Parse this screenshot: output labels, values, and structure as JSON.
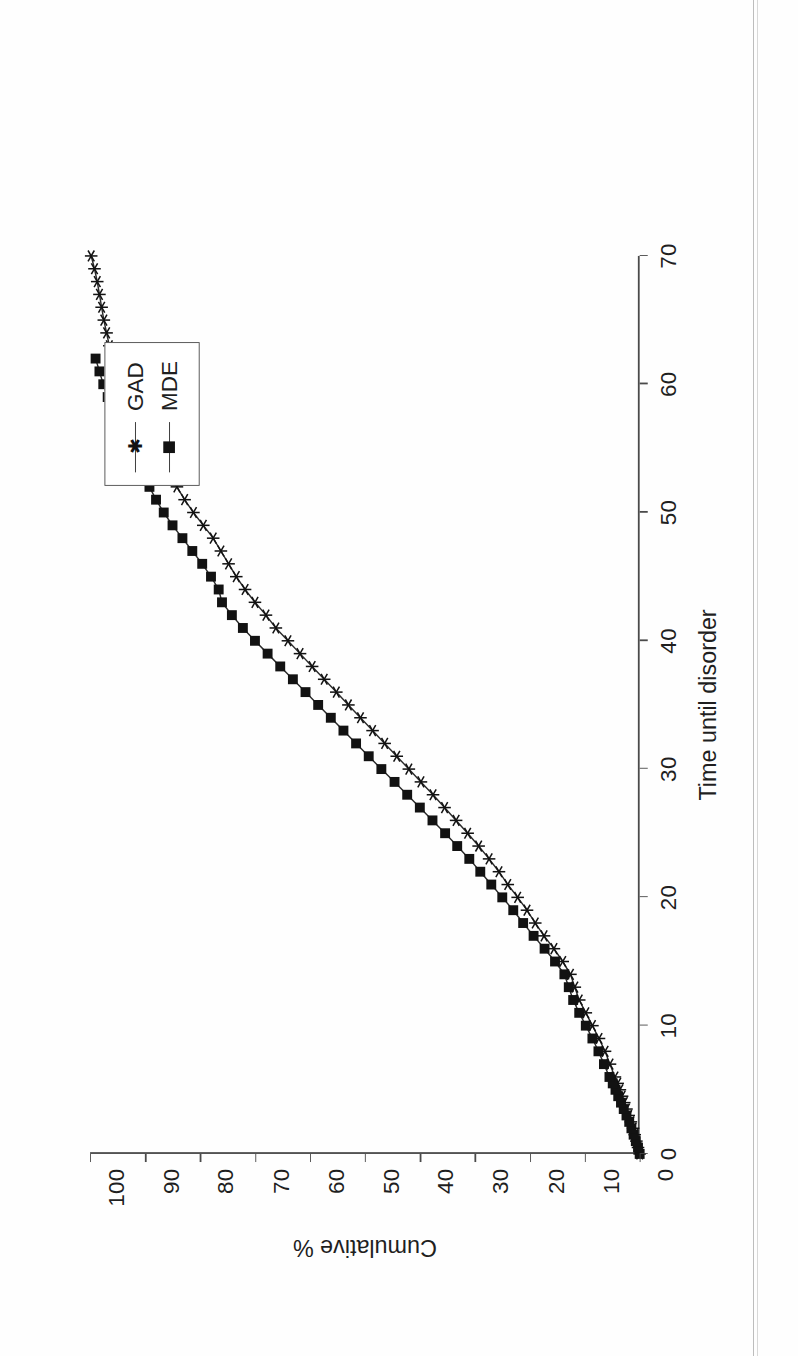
{
  "figure": {
    "background_color": "#ffffff",
    "ink_color": "#1f1f1f",
    "rotation": "90deg counter-clockwise (scanned landscape page)"
  },
  "legend": {
    "position": "top-right inside plot",
    "entries": [
      {
        "label": "GAD",
        "marker": "star",
        "marker_name": "star-marker"
      },
      {
        "label": "MDE",
        "marker": "square",
        "marker_name": "filled-square-marker"
      }
    ]
  },
  "axes": {
    "x": {
      "label": "Time until disorder",
      "ticks": [
        "0",
        "10",
        "20",
        "30",
        "40",
        "50",
        "60",
        "70"
      ],
      "min": 0,
      "max": 70
    },
    "y": {
      "label": "Cumulative %",
      "ticks": [
        "0",
        "10",
        "20",
        "30",
        "40",
        "50",
        "60",
        "70",
        "80",
        "90",
        "100"
      ],
      "min": 0,
      "max": 100
    }
  },
  "chart_data": {
    "type": "line",
    "title": "",
    "subtitle": "",
    "xlabel": "Time until disorder",
    "ylabel": "Cumulative %",
    "xlim": [
      0,
      70
    ],
    "ylim": [
      0,
      100
    ],
    "xticks": [
      0,
      10,
      20,
      30,
      40,
      50,
      60,
      70
    ],
    "yticks": [
      0,
      10,
      20,
      30,
      40,
      50,
      60,
      70,
      80,
      90,
      100
    ],
    "grid": false,
    "legend_position": "top-right",
    "annotations": [],
    "series": [
      {
        "name": "GAD",
        "marker": "star",
        "x": [
          0,
          0.5,
          1,
          1.5,
          2,
          2.5,
          3,
          3.5,
          4,
          4.5,
          5,
          5.5,
          6,
          7,
          8,
          9,
          10,
          11,
          12,
          13,
          14,
          15,
          16,
          17,
          18,
          19,
          20,
          21,
          22,
          23,
          24,
          25,
          26,
          27,
          28,
          29,
          30,
          31,
          32,
          33,
          34,
          35,
          36,
          37,
          38,
          39,
          40,
          41,
          42,
          43,
          44,
          45,
          46,
          47,
          48,
          49,
          50,
          51,
          52,
          53,
          54,
          55,
          56,
          57,
          58,
          59,
          60,
          61,
          62,
          63,
          64,
          65,
          66,
          67,
          68,
          69,
          70
        ],
        "y": [
          0,
          0.3,
          0.6,
          0.9,
          1.2,
          1.6,
          2.0,
          2.4,
          2.8,
          3.2,
          3.6,
          4.0,
          4.5,
          5.4,
          6.3,
          7.4,
          8.6,
          9.8,
          11.0,
          11.8,
          12.6,
          14.0,
          15.6,
          17.4,
          19.0,
          20.5,
          22.2,
          24.0,
          25.6,
          27.4,
          29.3,
          31.3,
          33.4,
          35.5,
          37.6,
          39.8,
          42.0,
          44.2,
          46.4,
          48.6,
          50.8,
          53.0,
          55.2,
          57.4,
          59.6,
          61.8,
          64.0,
          66.2,
          68.0,
          70.0,
          71.8,
          73.4,
          74.8,
          76.2,
          77.6,
          79.4,
          81.2,
          82.8,
          84.2,
          85.4,
          86.4,
          87.6,
          89.0,
          90.6,
          92.2,
          93.4,
          94.4,
          95.2,
          95.9,
          96.5,
          97.0,
          97.5,
          97.9,
          98.3,
          98.7,
          99.2,
          99.8
        ]
      },
      {
        "name": "MDE",
        "marker": "square",
        "x": [
          0,
          0.5,
          1,
          1.5,
          2,
          2.5,
          3,
          3.5,
          4,
          4.5,
          5,
          5.5,
          6,
          7,
          8,
          9,
          10,
          11,
          12,
          13,
          14,
          15,
          16,
          17,
          18,
          19,
          20,
          21,
          22,
          23,
          24,
          25,
          26,
          27,
          28,
          29,
          30,
          31,
          32,
          33,
          34,
          35,
          36,
          37,
          38,
          39,
          40,
          41,
          42,
          43,
          44,
          45,
          46,
          47,
          48,
          49,
          50,
          51,
          52,
          53,
          54,
          55,
          56,
          57,
          58,
          59,
          60,
          61,
          62
        ],
        "y": [
          0,
          0.3,
          0.7,
          1.1,
          1.5,
          1.9,
          2.4,
          2.9,
          3.4,
          3.9,
          4.4,
          4.9,
          5.5,
          6.5,
          7.5,
          8.6,
          9.8,
          11.0,
          12.1,
          12.9,
          13.7,
          15.4,
          17.3,
          19.3,
          21.2,
          23.0,
          25.0,
          27.0,
          29.0,
          31.0,
          33.2,
          35.4,
          37.7,
          40.0,
          42.3,
          44.6,
          47.0,
          49.3,
          51.6,
          53.9,
          56.2,
          58.5,
          60.8,
          63.1,
          65.4,
          67.7,
          70.0,
          72.2,
          74.2,
          76.0,
          76.6,
          78.0,
          79.6,
          81.4,
          83.2,
          85.0,
          86.6,
          88.0,
          89.2,
          90.4,
          91.4,
          92.6,
          93.8,
          95.0,
          96.0,
          96.8,
          97.6,
          98.3,
          99.0
        ]
      }
    ]
  }
}
